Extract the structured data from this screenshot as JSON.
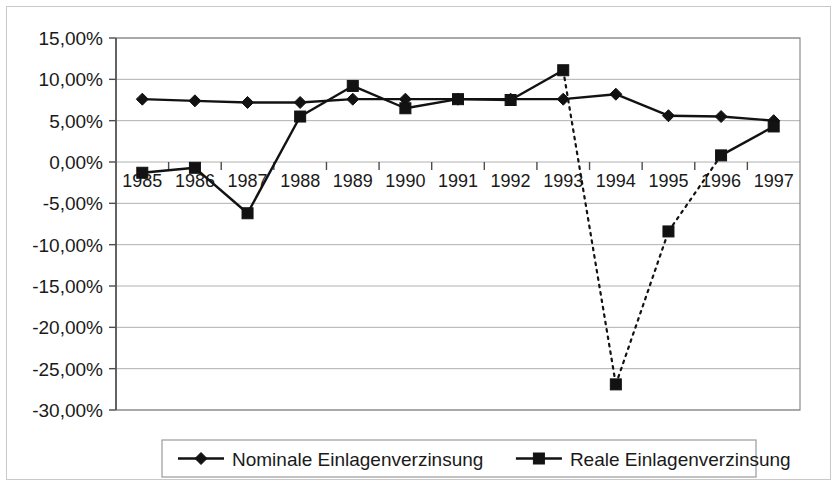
{
  "chart_data": {
    "type": "line",
    "title": "",
    "subtitle": "",
    "xlabel": "",
    "ylabel": "",
    "categories": [
      "1985",
      "1986",
      "1987",
      "1988",
      "1989",
      "1990",
      "1991",
      "1992",
      "1993",
      "1994",
      "1995",
      "1996",
      "1997"
    ],
    "ylim": [
      -30,
      15
    ],
    "ytick_labels": [
      "15,00%",
      "10,00%",
      "5,00%",
      "0,00%",
      "-5,00%",
      "-10,00%",
      "-15,00%",
      "-20,00%",
      "-25,00%",
      "-30,00%"
    ],
    "ytick_values": [
      15,
      10,
      5,
      0,
      -5,
      -10,
      -15,
      -20,
      -25,
      -30
    ],
    "grid": true,
    "legend_position": "bottom",
    "series": [
      {
        "name": "Nominale Einlagenverzinsung",
        "marker": "diamond",
        "line_style": "solid",
        "color": "#121212",
        "values": [
          7.6,
          7.4,
          7.2,
          7.2,
          7.6,
          7.6,
          7.6,
          7.6,
          7.6,
          8.2,
          5.6,
          5.5,
          5.0
        ]
      },
      {
        "name": "Reale Einlagenverzinsung",
        "marker": "square",
        "line_style": "solid-with-dashed-segments",
        "color": "#121212",
        "values": [
          -1.3,
          -0.7,
          -6.2,
          5.5,
          9.2,
          6.5,
          7.6,
          7.5,
          11.1,
          -26.9,
          -8.4,
          0.8,
          4.3
        ],
        "dashed_segments": [
          [
            8,
            9
          ],
          [
            9,
            10
          ],
          [
            10,
            11
          ]
        ]
      }
    ]
  },
  "legend": {
    "entries": [
      {
        "label": "Nominale Einlagenverzinsung",
        "marker": "diamond"
      },
      {
        "label": "Reale Einlagenverzinsung",
        "marker": "square"
      }
    ]
  }
}
